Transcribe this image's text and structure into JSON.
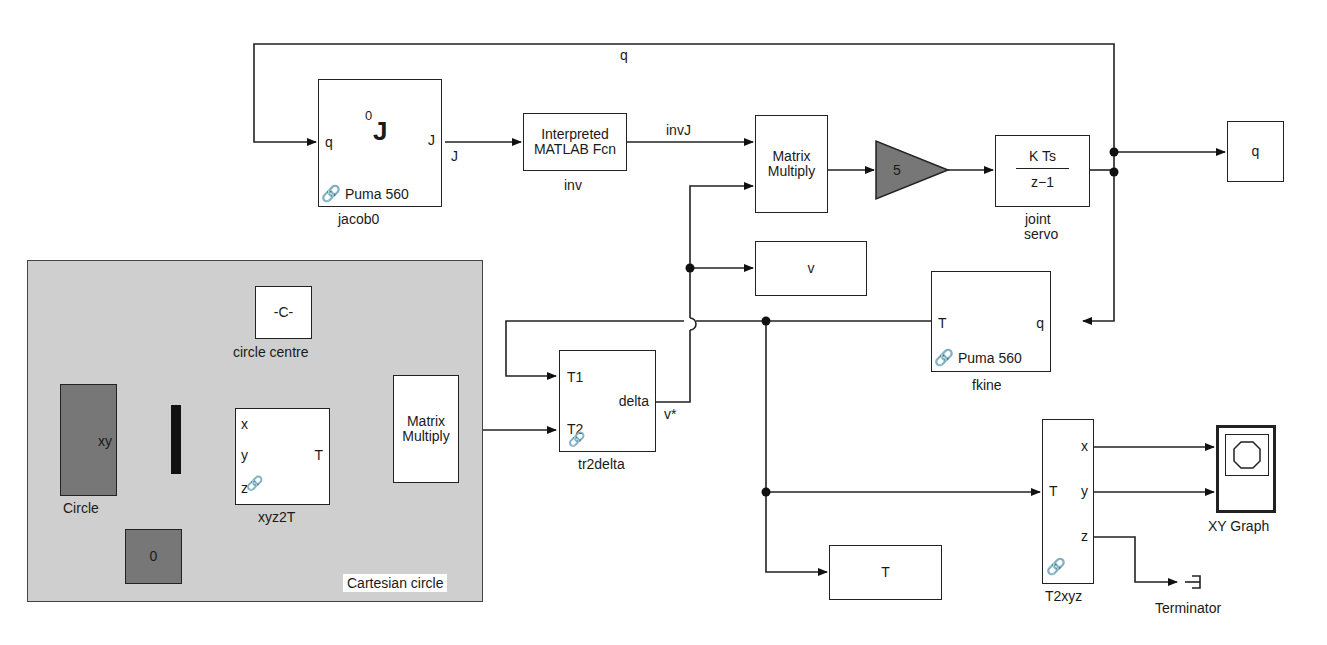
{
  "diagram": {
    "type": "simulink-model",
    "subsystem": {
      "label": "Cartesian circle"
    },
    "blocks": {
      "jacob0": {
        "name": "jacob0",
        "in_port": "q",
        "out_port": "J",
        "icon_sup": "0",
        "icon_main": "J",
        "footer": "Puma 560"
      },
      "inv": {
        "name": "inv",
        "line1": "Interpreted",
        "line2": "MATLAB Fcn"
      },
      "matmul_top": {
        "line1": "Matrix",
        "line2": "Multiply"
      },
      "gain": {
        "value": "5"
      },
      "joint_servo": {
        "name_line1": "joint",
        "name_line2": "servo",
        "num": "K Ts",
        "den": "z−1"
      },
      "q_out": {
        "label": "q"
      },
      "v_out": {
        "label": "v"
      },
      "fkine": {
        "name": "fkine",
        "in_port": "q",
        "out_port": "T",
        "footer": "Puma 560"
      },
      "circle_centre": {
        "name": "circle centre",
        "value": "-C-"
      },
      "circle": {
        "name": "Circle",
        "out_port": "xy"
      },
      "zero": {
        "value": "0"
      },
      "xyz2T": {
        "name": "xyz2T",
        "in_ports": [
          "x",
          "y",
          "z"
        ],
        "out_port": "T"
      },
      "matmul_sub": {
        "line1": "Matrix",
        "line2": "Multiply"
      },
      "tr2delta": {
        "name": "tr2delta",
        "in_ports": [
          "T1",
          "T2"
        ],
        "out_port": "delta"
      },
      "T_out": {
        "label": "T"
      },
      "T2xyz": {
        "name": "T2xyz",
        "in_port": "T",
        "out_ports": [
          "x",
          "y",
          "z"
        ]
      },
      "xy_graph": {
        "name": "XY Graph"
      },
      "terminator": {
        "name": "Terminator"
      }
    },
    "signals": {
      "q_top": "q",
      "J": "J",
      "invJ": "invJ",
      "q_servo": "q",
      "vstar": "v*"
    }
  }
}
